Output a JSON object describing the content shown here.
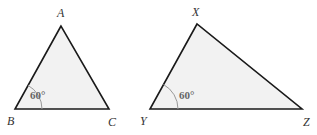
{
  "colors": {
    "fill": "#f2f2f2",
    "stroke": "#1a1a1a",
    "arc": "#999999",
    "label": "#333333",
    "angle_text": "#666666"
  },
  "triangles": [
    {
      "name": "ABC",
      "vertices": {
        "A": {
          "label": "A",
          "x": 61,
          "y": 26
        },
        "B": {
          "label": "B",
          "x": 15,
          "y": 109
        },
        "C": {
          "label": "C",
          "x": 109,
          "y": 109
        }
      },
      "angle": {
        "vertex": "B",
        "label": "60°"
      }
    },
    {
      "name": "XYZ",
      "vertices": {
        "X": {
          "label": "X",
          "x": 197,
          "y": 24
        },
        "Y": {
          "label": "Y",
          "x": 150,
          "y": 109
        },
        "Z": {
          "label": "Z",
          "x": 302,
          "y": 109
        }
      },
      "angle": {
        "vertex": "Y",
        "label": "60°"
      }
    }
  ]
}
